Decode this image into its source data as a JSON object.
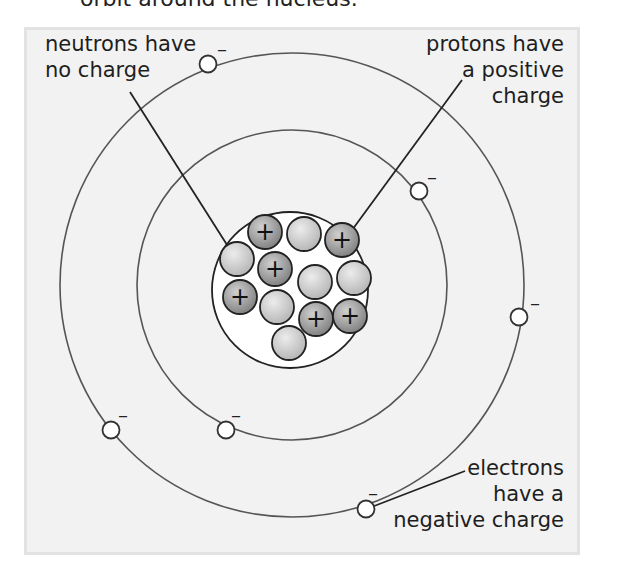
{
  "caption": "orbit around the nucleus.",
  "labels": {
    "neutrons": [
      "neutrons have",
      "no charge"
    ],
    "protons": [
      "protons have",
      "a positive",
      "charge"
    ],
    "electrons": [
      "electrons",
      "have a",
      "negative charge"
    ]
  },
  "symbols": {
    "proton": "+",
    "electron": "–"
  },
  "colors": {
    "panel_bg": "#f2f2f2",
    "orbit": "#555555",
    "proton_fill": "#8f8f8f",
    "neutron_fill": "#c9c9c9",
    "electron_fill": "#ffffff"
  },
  "atom": {
    "nucleus": {
      "protons": 6,
      "neutrons": 6
    },
    "shells": [
      {
        "name": "inner",
        "electrons": 2
      },
      {
        "name": "outer",
        "electrons": 4
      }
    ]
  }
}
